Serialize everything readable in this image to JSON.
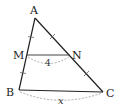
{
  "diagram": {
    "type": "geometry-triangle",
    "points": {
      "A": {
        "label": "A",
        "x": 35,
        "y": 18
      },
      "B": {
        "label": "B",
        "x": 19,
        "y": 90
      },
      "C": {
        "label": "C",
        "x": 103,
        "y": 92
      },
      "M": {
        "label": "M",
        "x": 27,
        "y": 55
      },
      "N": {
        "label": "N",
        "x": 70,
        "y": 55
      }
    },
    "segments": [
      {
        "from": "A",
        "to": "B"
      },
      {
        "from": "A",
        "to": "C"
      },
      {
        "from": "B",
        "to": "C"
      },
      {
        "from": "M",
        "to": "N"
      }
    ],
    "measures": {
      "MN": "4",
      "BC": "x"
    },
    "tick_marks": [
      "AM",
      "MB",
      "AN",
      "NC"
    ],
    "colors": {
      "line": "#222222",
      "dashed_arc": "#999999",
      "background": "#ffffff"
    }
  }
}
